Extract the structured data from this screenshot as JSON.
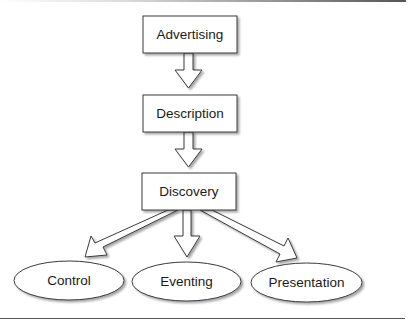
{
  "diagram": {
    "type": "flowchart",
    "colors": {
      "stroke": "#3a3a3a",
      "fill": "#ffffff",
      "shadow": "#bdbdbd",
      "rule": "#555555",
      "text": "#1a1a1a"
    },
    "boxes": [
      {
        "id": "advertising",
        "label": "Advertising"
      },
      {
        "id": "description",
        "label": "Description"
      },
      {
        "id": "discovery",
        "label": "Discovery"
      }
    ],
    "ellipses": [
      {
        "id": "control",
        "label": "Control"
      },
      {
        "id": "eventing",
        "label": "Eventing"
      },
      {
        "id": "presentation",
        "label": "Presentation"
      }
    ],
    "edges": [
      {
        "from": "Advertising",
        "to": "Description"
      },
      {
        "from": "Description",
        "to": "Discovery"
      },
      {
        "from": "Discovery",
        "to": "Control"
      },
      {
        "from": "Discovery",
        "to": "Eventing"
      },
      {
        "from": "Discovery",
        "to": "Presentation"
      }
    ]
  }
}
